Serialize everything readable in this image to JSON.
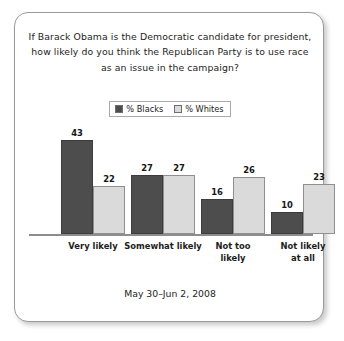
{
  "card": {
    "background": "#ffffff",
    "border_color": "#9a9a9a"
  },
  "title": {
    "line1": "If Barack Obama is the Democratic candidate for president,",
    "line2": "how likely do you think the Republican Party is to use race",
    "line3": "as an issue in the campaign?"
  },
  "legend": {
    "entries": [
      {
        "label": "% Blacks",
        "color": "#4d4d4d",
        "swatch_name": "legend-swatch-blacks"
      },
      {
        "label": "% Whites",
        "color": "#dadada",
        "swatch_name": "legend-swatch-whites"
      }
    ]
  },
  "footer": {
    "date_range": "May 30–Jun 2, 2008"
  },
  "axis": {
    "baseline_color": "#8d8d8d"
  },
  "chart_data": {
    "type": "bar",
    "title": "If Barack Obama is the Democratic candidate for president, how likely do you think the Republican Party is to use race as an issue in the campaign?",
    "subtitle": "May 30–Jun 2, 2008",
    "xlabel": "",
    "ylabel": "",
    "ylim": [
      0,
      50
    ],
    "grid": false,
    "legend_position": "top-center",
    "value_labels": true,
    "categories": [
      "Very likely",
      "Somewhat likely",
      "Not too likely",
      "Not likely at all"
    ],
    "category_lines": [
      [
        "Very likely"
      ],
      [
        "Somewhat likely"
      ],
      [
        "Not too",
        "likely"
      ],
      [
        "Not likely",
        "at all"
      ]
    ],
    "series": [
      {
        "name": "% Blacks",
        "color": "#4d4d4d",
        "values": [
          43,
          27,
          16,
          10
        ]
      },
      {
        "name": "% Whites",
        "color": "#dadada",
        "values": [
          22,
          27,
          26,
          23
        ]
      }
    ]
  }
}
